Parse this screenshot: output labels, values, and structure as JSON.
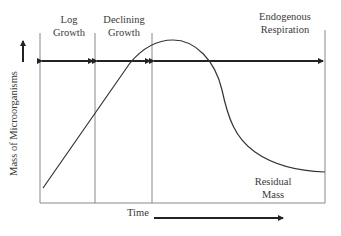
{
  "diagram": {
    "phases": [
      {
        "label_line1": "Log",
        "label_line2": "Growth"
      },
      {
        "label_line1": "Declining",
        "label_line2": "Growth"
      },
      {
        "label_line1": "Endogenous",
        "label_line2": "Respiration"
      }
    ],
    "y_axis_label": "Mass of Microorganisms",
    "x_axis_label": "Time",
    "annotation": {
      "line1": "Residual",
      "line2": "Mass"
    },
    "colors": {
      "line": "#333333",
      "divider": "#888888",
      "text": "#3a3a3a"
    }
  }
}
